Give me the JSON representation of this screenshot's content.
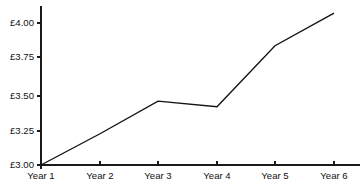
{
  "chart_data": {
    "type": "line",
    "title": "",
    "subtitle": "",
    "xlabel": "",
    "ylabel": "",
    "categories": [
      "Year 1",
      "Year 2",
      "Year 3",
      "Year 4",
      "Year 5",
      "Year 6"
    ],
    "values": [
      3.0,
      3.22,
      3.45,
      3.41,
      3.84,
      4.07
    ],
    "series": [
      {
        "name": "",
        "values": [
          3.0,
          3.22,
          3.45,
          3.41,
          3.84,
          4.07
        ]
      }
    ],
    "ylim": [
      3.0,
      4.1
    ],
    "yticks": [
      3.0,
      3.25,
      3.5,
      3.75,
      4.0
    ],
    "ytick_labels": [
      "£3.00",
      "£3.25",
      "£3.50",
      "£3.75",
      "£4.00"
    ],
    "xtick_labels": [
      "Year 1",
      "Year 2",
      "Year 3",
      "Year 4",
      "Year 5",
      "Year 6"
    ],
    "grid": false,
    "legend": false,
    "legend_position": "none",
    "currency_symbol": "£",
    "line_color": "#111111",
    "axis_color": "#1a1a1a",
    "background_color": "#ffffff",
    "annotations": []
  },
  "layout": {
    "width": 363,
    "height": 195,
    "plot_left": 41,
    "plot_right": 334,
    "plot_top": 6,
    "plot_bottom": 165,
    "y_axis_top": 6,
    "x_tick_positions": [
      41,
      100,
      158,
      217,
      275,
      334
    ],
    "y_tick_positions": [
      165,
      131,
      96,
      57,
      23
    ],
    "x_label_y": 172,
    "tick_length": 4
  }
}
